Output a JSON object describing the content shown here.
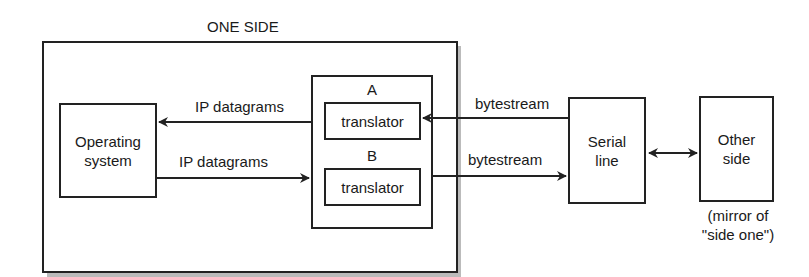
{
  "diagram": {
    "group_title": "ONE SIDE",
    "nodes": {
      "operating_system": {
        "line1": "Operating",
        "line2": "system"
      },
      "translator_group": {
        "label_a": "A",
        "label_b": "B"
      },
      "translator_a": {
        "label": "translator"
      },
      "translator_b": {
        "label": "translator"
      },
      "serial_line": {
        "line1": "Serial",
        "line2": "line"
      },
      "other_side": {
        "line1": "Other",
        "line2": "side"
      }
    },
    "edges": {
      "ip_to_os": {
        "label": "IP datagrams",
        "direction": "translator A -> operating system"
      },
      "ip_from_os": {
        "label": "IP datagrams",
        "direction": "operating system -> translator B"
      },
      "bytes_in": {
        "label": "bytestream",
        "direction": "serial line -> translator A"
      },
      "bytes_out": {
        "label": "bytestream",
        "direction": "translator B -> serial line"
      },
      "serial_other": {
        "direction": "bidirectional"
      }
    },
    "note": {
      "line1": "(mirror of",
      "line2": "\"side one\")"
    }
  }
}
